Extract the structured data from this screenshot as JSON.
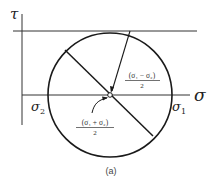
{
  "diagram": {
    "caption": "(a)",
    "axes": {
      "vertical_label": "τ",
      "horizontal_label": "σ"
    },
    "points": {
      "sigma2_label": "σ",
      "sigma2_sub": "2",
      "sigma1_label": "σ",
      "sigma1_sub": "1"
    },
    "annotations": {
      "radius_numerator": "(σ₁ − σ₂)",
      "radius_denominator": "2",
      "center_numerator": "(σ₁ + σ₂)",
      "center_denominator": "2"
    },
    "colors": {
      "line": "#1a1a1a",
      "text": "#222222"
    }
  }
}
